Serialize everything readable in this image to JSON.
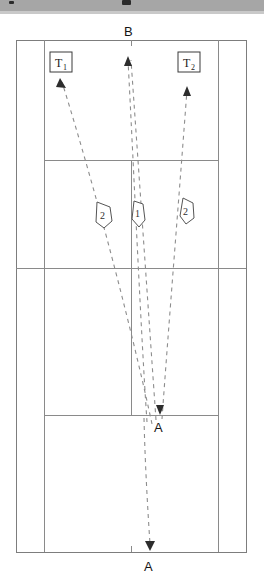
{
  "figure": {
    "kind": "tennis-court-diagram",
    "title_text": "",
    "background_color": "#ffffff",
    "line_color": "#8a8a8a",
    "trajectory_color": "#8d8d8d",
    "scan_band_color": "#a6a6a6"
  },
  "labels": {
    "top_point": "B",
    "mid_point": "A",
    "bottom_point": "A",
    "team_left_main": "T",
    "team_left_sub": "1",
    "team_right_main": "T",
    "team_right_sub": "2"
  },
  "markers": [
    {
      "id": "marker-left",
      "value": "2"
    },
    {
      "id": "marker-center",
      "value": "1"
    },
    {
      "id": "marker-right",
      "value": "2"
    }
  ],
  "court": {
    "outer_left": 16,
    "outer_right": 246,
    "inner_left": 44,
    "inner_right": 218,
    "baseline_top": 26,
    "baseline_bottom": 538,
    "service_line_top": 146,
    "net_line": 254,
    "service_line_bottom": 401,
    "center_x": 131
  },
  "trajectories": [
    {
      "id": "path-to-t1",
      "label": "T1 arrival path"
    },
    {
      "id": "path-to-b-1",
      "label": "B arrival path A"
    },
    {
      "id": "path-to-b-2",
      "label": "B arrival path B"
    },
    {
      "id": "path-to-t2",
      "label": "T2 arrival path"
    },
    {
      "id": "path-to-a-bottom",
      "label": "A bottom path"
    }
  ]
}
